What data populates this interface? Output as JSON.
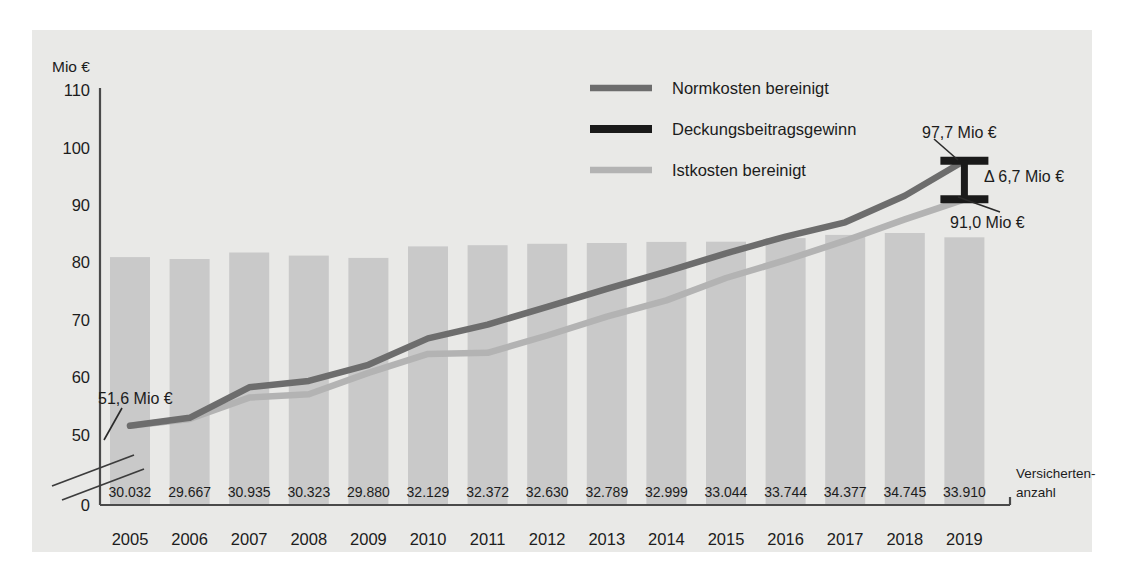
{
  "panel": {
    "background_color": "#e9e9e7",
    "page_background": "#ffffff"
  },
  "axis": {
    "y_unit_label": "Mio €",
    "y_ticks": [
      "110",
      "100",
      "90",
      "80",
      "70",
      "60",
      "50",
      "0"
    ],
    "y_break_note": "axis break between 50 and 0",
    "x_right_label_line1": "Versicherten-",
    "x_right_label_line2": "anzahl"
  },
  "legend": {
    "items": [
      {
        "label": "Normkosten bereinigt",
        "color": "#6d6d6d"
      },
      {
        "label": "Deckungsbeitragsgewinn",
        "color": "#1a1a1a"
      },
      {
        "label": "Istkosten bereinigt",
        "color": "#b3b3b3"
      }
    ]
  },
  "annotations": [
    {
      "name": "start-value",
      "text": "51,6 Mio €"
    },
    {
      "name": "top-value",
      "text": "97,7 Mio €"
    },
    {
      "name": "delta-value",
      "text": "Δ 6,7 Mio €"
    },
    {
      "name": "bottom-value",
      "text": "91,0 Mio €"
    }
  ],
  "chart_data": {
    "type": "line",
    "title": "",
    "xlabel": "",
    "ylabel": "Mio €",
    "ylim": [
      50,
      110
    ],
    "grid": false,
    "legend_position": "top-center",
    "categories": [
      "2005",
      "2006",
      "2007",
      "2008",
      "2009",
      "2010",
      "2011",
      "2012",
      "2013",
      "2014",
      "2015",
      "2016",
      "2017",
      "2018",
      "2019"
    ],
    "series": [
      {
        "name": "Normkosten bereinigt",
        "color": "#6d6d6d",
        "values": [
          51.6,
          53.0,
          58.3,
          59.4,
          62.2,
          66.8,
          69.2,
          72.3,
          75.4,
          78.4,
          81.6,
          84.5,
          87.0,
          91.6,
          97.7
        ]
      },
      {
        "name": "Istkosten bereinigt",
        "color": "#b3b3b3",
        "values": [
          51.6,
          52.8,
          56.5,
          57.1,
          60.8,
          64.1,
          64.3,
          67.3,
          70.6,
          73.4,
          77.3,
          80.4,
          83.8,
          87.5,
          91.0
        ]
      }
    ],
    "bars": {
      "name": "Versichertenanzahl",
      "color": "#c9c9c9",
      "labels": [
        "30.032",
        "29.667",
        "30.935",
        "30.323",
        "29.880",
        "32.129",
        "32.372",
        "32.630",
        "32.789",
        "32.999",
        "33.044",
        "33.744",
        "34.377",
        "34.745",
        "33.910"
      ],
      "values": [
        30032,
        29667,
        30935,
        30323,
        29880,
        32129,
        32372,
        32630,
        32789,
        32999,
        33044,
        33744,
        34377,
        34745,
        33910
      ]
    },
    "delta_marker": {
      "name": "Deckungsbeitragsgewinn",
      "color": "#1a1a1a",
      "top": 97.7,
      "bottom": 91.0,
      "delta": 6.7,
      "at_category": "2019"
    }
  }
}
